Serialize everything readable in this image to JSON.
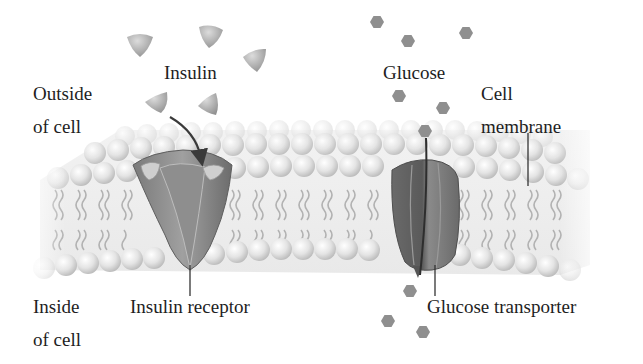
{
  "diagram": {
    "labels": {
      "insulin": "Insulin",
      "glucose": "Glucose",
      "outside_of_cell": [
        "Outside",
        "of cell"
      ],
      "inside_of_cell": [
        "Inside",
        "of cell"
      ],
      "cell_membrane": [
        "Cell",
        "membrane"
      ],
      "insulin_receptor": "Insulin receptor",
      "glucose_transporter": "Glucose transporter"
    },
    "molecules": {
      "insulin": {
        "shape": "triangle-icon",
        "color": "#a8a8a8",
        "positions": [
          [
            140,
            43
          ],
          [
            208,
            37
          ],
          [
            253,
            58
          ],
          [
            160,
            101
          ],
          [
            212,
            104
          ],
          [
            146,
            173
          ]
        ]
      },
      "glucose_outside": {
        "shape": "hexagon-icon",
        "color": "#8c8c8c",
        "positions": [
          [
            377,
            22
          ],
          [
            408,
            42
          ],
          [
            466,
            32
          ],
          [
            399,
            97
          ],
          [
            443,
            108
          ],
          [
            425,
            130
          ]
        ]
      },
      "glucose_inside": {
        "shape": "hexagon-icon",
        "color": "#8c8c8c",
        "positions": [
          [
            410,
            290
          ],
          [
            388,
            320
          ],
          [
            423,
            333
          ]
        ]
      }
    },
    "colors": {
      "lipid_head": "#e6e6e6",
      "lipid_tail": "#b0b0b0",
      "protein_dark": "#6e6e6e",
      "protein_mid": "#8a8a8a",
      "leader_line": "#333333",
      "text": "#1e1e1e"
    }
  }
}
